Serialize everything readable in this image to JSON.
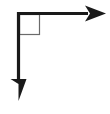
{
  "figure": {
    "type": "geometry-diagram",
    "width": 110,
    "height": 114,
    "background_color": "#ffffff",
    "stroke_color": "#1a1a1a",
    "marker_stroke_color": "#6b6b6b",
    "vertex": {
      "x": 18.5,
      "y": 13.5,
      "label": ""
    },
    "rays": [
      {
        "name": "horizontal-ray",
        "direction": "right",
        "arrowhead": "solid-triangle",
        "shaft_thickness": 3,
        "from": {
          "x": 18.5,
          "y": 13.5
        },
        "to": {
          "x": 106,
          "y": 13.5
        },
        "arrow_length": 21,
        "arrow_half_width": 8
      },
      {
        "name": "vertical-ray",
        "direction": "down",
        "arrowhead": "solid-triangle",
        "shaft_thickness": 3,
        "from": {
          "x": 18.5,
          "y": 13.5
        },
        "to": {
          "x": 18.5,
          "y": 101
        },
        "arrow_length": 23,
        "arrow_half_width": 8
      }
    ],
    "right_angle_marker": {
      "name": "right-angle-square",
      "shape": "square",
      "size": 21,
      "x": 19,
      "y": 14,
      "stroke_width": 1,
      "fill": "none",
      "angle_degrees": 90
    }
  }
}
